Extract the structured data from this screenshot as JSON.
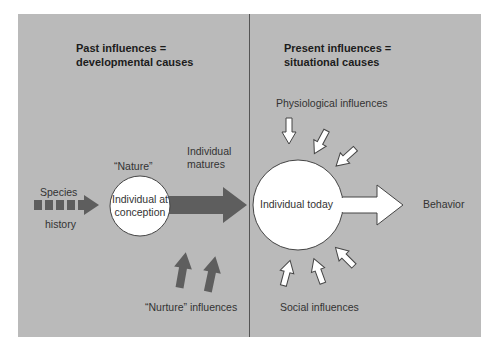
{
  "colors": {
    "panel_bg": "#bababa",
    "divider": "#555555",
    "dark_arrow": "#5e5e5e",
    "white_shape": "#ffffff",
    "outline": "#444444"
  },
  "left": {
    "heading_line1": "Past influences =",
    "heading_line2": "developmental causes",
    "species_label": "Species",
    "history_label": "history",
    "nature_label": "“Nature”",
    "circle_line1": "Individual at",
    "circle_line2": "conception",
    "matures_line1": "Individual",
    "matures_line2": "matures",
    "nurture_label": "“Nurture” influences"
  },
  "right": {
    "heading_line1": "Present influences =",
    "heading_line2": "situational causes",
    "physiological_label": "Physiological influences",
    "circle_label": "Individual today",
    "behavior_label": "Behavior",
    "social_label": "Social influences"
  }
}
